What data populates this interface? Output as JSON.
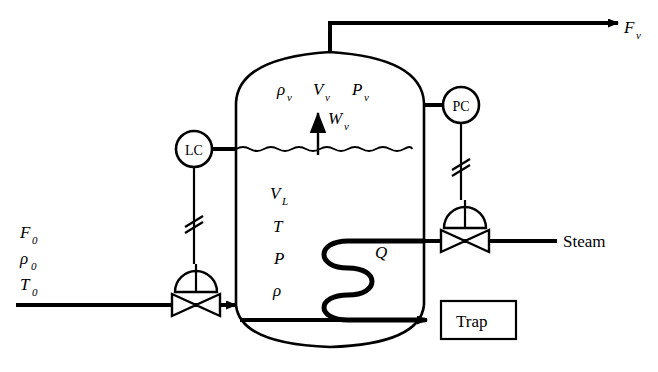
{
  "diagram": {
    "line_color": "#000000",
    "background": "#ffffff"
  },
  "feed": {
    "flow_label": "F",
    "flow_sub": "0",
    "density_label": "ρ",
    "density_sub": "0",
    "temperature_label": "T",
    "temperature_sub": "0"
  },
  "vapor_outlet": {
    "label": "F",
    "sub": "v"
  },
  "vapor_space": {
    "density_label": "ρ",
    "density_sub": "v",
    "volume_label": "V",
    "volume_sub": "v",
    "pressure_label": "P",
    "pressure_sub": "v",
    "mass_flow_label": "W",
    "mass_flow_sub": "v"
  },
  "liquid_space": {
    "volume_label": "V",
    "volume_sub": "L",
    "temperature_label": "T",
    "pressure_label": "P",
    "density_label": "ρ"
  },
  "heat": {
    "label": "Q"
  },
  "controllers": [
    {
      "tag": "LC",
      "name": "level-controller"
    },
    {
      "tag": "PC",
      "name": "pressure-controller"
    }
  ],
  "utilities": {
    "steam_label": "Steam",
    "trap_label": "Trap"
  }
}
